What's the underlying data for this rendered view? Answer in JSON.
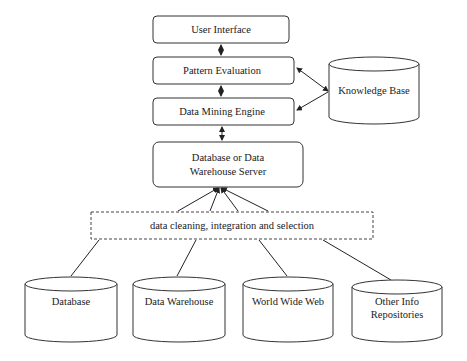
{
  "diagram": {
    "layers": {
      "user_interface": "User Interface",
      "pattern_evaluation": "Pattern Evaluation",
      "data_mining_engine": "Data Mining Engine",
      "server_line1": "Database or Data",
      "server_line2": "Warehouse Server",
      "cleaning": "data cleaning, integration and selection"
    },
    "knowledge_base": "Knowledge Base",
    "sources": [
      {
        "line1": "Database",
        "line2": ""
      },
      {
        "line1": "Data Warehouse",
        "line2": ""
      },
      {
        "line1": "World Wide Web",
        "line2": ""
      },
      {
        "line1": "Other Info",
        "line2": "Repositories"
      }
    ],
    "edges": [
      {
        "from": "User Interface",
        "to": "Pattern Evaluation",
        "type": "bidirectional"
      },
      {
        "from": "Pattern Evaluation",
        "to": "Data Mining Engine",
        "type": "bidirectional"
      },
      {
        "from": "Data Mining Engine",
        "to": "Database or Data Warehouse Server",
        "type": "bidirectional"
      },
      {
        "from": "Knowledge Base",
        "to": "Pattern Evaluation",
        "type": "bidirectional"
      },
      {
        "from": "Knowledge Base",
        "to": "Data Mining Engine",
        "type": "bidirectional"
      },
      {
        "from": "data cleaning, integration and selection",
        "to": "Database or Data Warehouse Server",
        "type": "arrow"
      },
      {
        "from": "Database",
        "to": "data cleaning, integration and selection",
        "type": "line"
      },
      {
        "from": "Data Warehouse",
        "to": "data cleaning, integration and selection",
        "type": "line"
      },
      {
        "from": "World Wide Web",
        "to": "data cleaning, integration and selection",
        "type": "line"
      },
      {
        "from": "Other Info Repositories",
        "to": "data cleaning, integration and selection",
        "type": "line"
      }
    ]
  }
}
